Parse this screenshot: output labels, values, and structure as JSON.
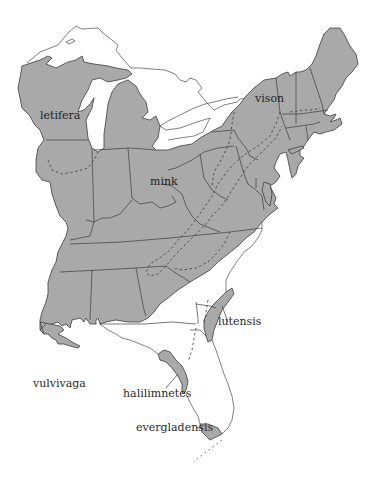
{
  "map": {
    "subject": "Subspecies ranges of American mink (Neovison vison) in the eastern United States",
    "colors": {
      "range_fill": "#a9a9a9",
      "state_border": "#3c3c3c",
      "background": "#ffffff"
    },
    "labels": [
      {
        "id": "letifera",
        "text": "letifera"
      },
      {
        "id": "vison",
        "text": "vison"
      },
      {
        "id": "mink",
        "text": "mink"
      },
      {
        "id": "lutensis",
        "text": "lutensis"
      },
      {
        "id": "vulvivaga",
        "text": "vulvivaga"
      },
      {
        "id": "halilimnetes",
        "text": "halilimnetes"
      },
      {
        "id": "evergladensis",
        "text": "evergladensis"
      }
    ],
    "legend": {
      "dashed_line": "subspecies range boundary",
      "shaded_area": "mink range"
    }
  }
}
